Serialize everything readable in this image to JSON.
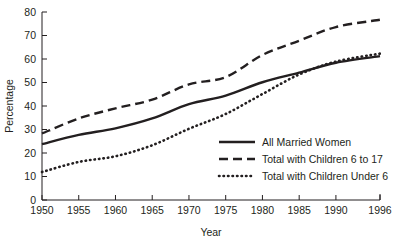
{
  "chart_data": {
    "type": "line",
    "title": "",
    "xlabel": "Year",
    "ylabel": "Percentage",
    "xlim": [
      1950,
      1996
    ],
    "ylim": [
      0,
      80
    ],
    "grid": false,
    "legend_position": "bottom-right",
    "xticks": [
      1950,
      1955,
      1960,
      1965,
      1970,
      1975,
      1980,
      1985,
      1990,
      1996
    ],
    "xtick_labels": [
      "1950",
      "1955",
      "1960",
      "1965",
      "1970",
      "1975",
      "1980",
      "1985",
      "1990",
      "1996"
    ],
    "yticks": [
      0,
      10,
      20,
      30,
      40,
      50,
      60,
      70,
      80
    ],
    "ytick_labels": [
      "0",
      "10",
      "20",
      "30",
      "40",
      "50",
      "60",
      "70",
      "80"
    ],
    "x": [
      1950,
      1955,
      1960,
      1965,
      1970,
      1975,
      1980,
      1985,
      1990,
      1996
    ],
    "series": [
      {
        "name": "All Married Women",
        "style": "solid",
        "values": [
          23.8,
          27.7,
          30.5,
          34.7,
          40.8,
          44.4,
          50.1,
          54.2,
          58.4,
          61.2
        ]
      },
      {
        "name": "Total with Children 6 to 17",
        "style": "dashed",
        "values": [
          28.3,
          34.7,
          39.0,
          42.7,
          49.2,
          52.3,
          61.7,
          67.8,
          73.6,
          76.7
        ]
      },
      {
        "name": "Total with Children Under 6",
        "style": "dotted",
        "values": [
          11.9,
          16.2,
          18.6,
          23.3,
          30.3,
          36.6,
          45.1,
          53.4,
          58.9,
          62.3
        ]
      }
    ]
  },
  "legend": {
    "items": [
      {
        "label": "All Married Women",
        "style": "solid"
      },
      {
        "label": "Total with Children 6 to 17",
        "style": "dashed"
      },
      {
        "label": "Total with Children Under 6",
        "style": "dotted"
      }
    ]
  }
}
